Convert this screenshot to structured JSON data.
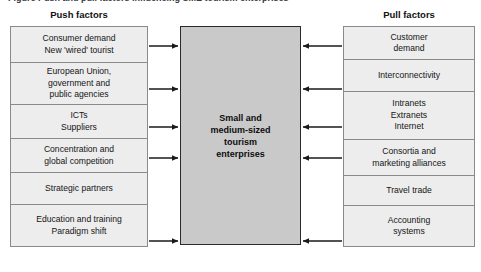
{
  "figure": {
    "caption": "Figure   Push and pull factors influencing SME tourism enterprises",
    "background_color": "#ffffff"
  },
  "colors": {
    "center_fill": "#c9c9c9",
    "center_border": "#2b2b2b",
    "side_fill": "#ededed",
    "side_border": "#8a8a8a",
    "arrow": "#1a1a1a",
    "text": "#111111"
  },
  "push": {
    "header": "Push factors",
    "items": [
      {
        "label": "Consumer demand\nNew 'wired' tourist",
        "has_arrow": true
      },
      {
        "label": "European Union,\ngovernment and\npublic agencies",
        "has_arrow": true
      },
      {
        "label": "ICTs\nSuppliers",
        "has_arrow": true
      },
      {
        "label": "Concentration and\nglobal competition",
        "has_arrow": true
      },
      {
        "label": "Strategic partners",
        "has_arrow": false
      },
      {
        "label": "Education and training\nParadigm shift",
        "has_arrow": true
      }
    ]
  },
  "center": {
    "label": "Small and\nmedium-sized\ntourism\nenterprises"
  },
  "pull": {
    "header": "Pull factors",
    "items": [
      {
        "label": "Customer\ndemand",
        "has_arrow": true
      },
      {
        "label": "Interconnectivity",
        "has_arrow": true
      },
      {
        "label": "Intranets\nExtranets\nInternet",
        "has_arrow": true
      },
      {
        "label": "Consortia and\nmarketing alliances",
        "has_arrow": true
      },
      {
        "label": "Travel trade",
        "has_arrow": false
      },
      {
        "label": "Accounting\nsystems",
        "has_arrow": true
      }
    ]
  },
  "arrows": {
    "left_direction": "right",
    "right_direction": "left",
    "left_count": 5,
    "right_count": 5
  },
  "layout": {
    "push_box_heights": [
      36,
      42,
      34,
      34,
      32,
      41
    ],
    "pull_box_heights": [
      33,
      32,
      48,
      36,
      30,
      40
    ],
    "arrow_y": [
      46,
      89,
      127,
      158,
      241
    ]
  }
}
